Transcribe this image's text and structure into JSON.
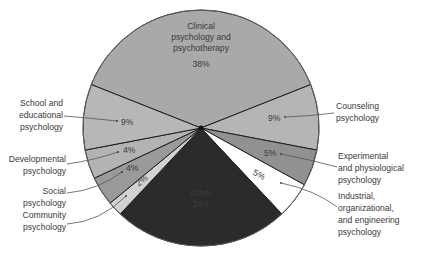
{
  "chart_data": {
    "type": "pie",
    "title": "",
    "center": [
      201,
      128
    ],
    "radius": 118,
    "start_angle_deg": -68.4,
    "slices": [
      {
        "id": "clinical",
        "label": "Clinical psychology and psychotherapy",
        "label_lines": [
          "Clinical",
          "psychology and",
          "psychotherapy"
        ],
        "value": 38,
        "value_label": "38%",
        "color": "#a9a9a9"
      },
      {
        "id": "counseling",
        "label": "Counseling psychology",
        "label_lines": [
          "Counseling",
          "psychology"
        ],
        "value": 9,
        "value_label": "9%",
        "color": "#b5b5b5"
      },
      {
        "id": "experimental",
        "label": "Experimental and physiological psychology",
        "label_lines": [
          "Experimental",
          "and physiological",
          "psychology"
        ],
        "value": 5,
        "value_label": "5%",
        "color": "#919191"
      },
      {
        "id": "industrial",
        "label": "Industrial, organizational, and engineering psychology",
        "label_lines": [
          "Industrial,",
          "organizational,",
          "and engineering",
          "psychology"
        ],
        "value": 5,
        "value_label": "5%",
        "color": "#ffffff"
      },
      {
        "id": "other",
        "label": "Other",
        "label_lines": [
          "Other"
        ],
        "value": 24,
        "value_label": "24%",
        "color": "#2b2b2b"
      },
      {
        "id": "community",
        "label": "Community psychology",
        "label_lines": [
          "Community",
          "psychology"
        ],
        "value": 2,
        "value_label": "2%",
        "color": "#d2d2d2"
      },
      {
        "id": "social",
        "label": "Social psychology",
        "label_lines": [
          "Social",
          "psychology"
        ],
        "value": 4,
        "value_label": "4%",
        "color": "#9a9a9a"
      },
      {
        "id": "developmental",
        "label": "Developmental psychology",
        "label_lines": [
          "Developmental",
          "psychology"
        ],
        "value": 4,
        "value_label": "4%",
        "color": "#b3b3b3"
      },
      {
        "id": "school",
        "label": "School and educational psychology",
        "label_lines": [
          "School and",
          "educational",
          "psychology"
        ],
        "value": 9,
        "value_label": "9%",
        "color": "#b7b7b7"
      }
    ],
    "legend": "none (external callout labels with leader lines)"
  },
  "labels": {
    "clinical": {
      "lines": [
        "Clinical",
        "psychology and",
        "psychotherapy"
      ],
      "pct": "38%"
    },
    "counseling": {
      "lines": [
        "Counseling",
        "psychology"
      ],
      "pct": "9%"
    },
    "experimental": {
      "lines": [
        "Experimental",
        "and physiological",
        "psychology"
      ],
      "pct": "5%"
    },
    "industrial": {
      "lines": [
        "Industrial,",
        "organizational,",
        "and engineering",
        "psychology"
      ],
      "pct": "5%"
    },
    "other": {
      "lines": [
        "Other"
      ],
      "pct": "24%"
    },
    "community": {
      "lines": [
        "Community",
        "psychology"
      ],
      "pct": "2%"
    },
    "social": {
      "lines": [
        "Social",
        "psychology"
      ],
      "pct": "4%"
    },
    "developmental": {
      "lines": [
        "Developmental",
        "psychology"
      ],
      "pct": "4%"
    },
    "school": {
      "lines": [
        "School and",
        "educational",
        "psychology"
      ],
      "pct": "9%"
    }
  }
}
